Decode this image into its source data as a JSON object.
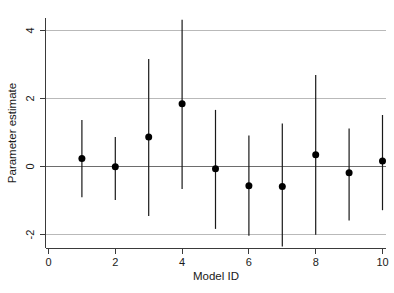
{
  "chart_data": {
    "type": "scatter",
    "title": "",
    "subtitle": "",
    "xlabel": "Model ID",
    "ylabel": "Parameter estimate",
    "xlim": [
      0,
      10.6
    ],
    "ylim": [
      -2.55,
      4.45
    ],
    "xticks": [
      0,
      2,
      4,
      6,
      8,
      10
    ],
    "xtick_labels": [
      "0",
      "2",
      "4",
      "6",
      "8",
      "10"
    ],
    "yticks": [
      -2,
      0,
      2,
      4
    ],
    "ytick_labels": [
      "-2",
      "0",
      "2",
      "4"
    ],
    "grid": "horizontal-at-yticks",
    "legend": "none",
    "reference_line": 0,
    "error_bar_style": "vertical-line-no-caps",
    "marker": "filled-circle",
    "x": [
      1,
      2,
      3,
      4,
      5,
      6,
      7,
      8,
      9,
      10
    ],
    "categories": [
      "1",
      "2",
      "3",
      "4",
      "5",
      "6",
      "7",
      "8",
      "9",
      "10"
    ],
    "values": [
      0.22,
      -0.02,
      0.85,
      1.83,
      -0.08,
      -0.58,
      -0.6,
      0.33,
      -0.2,
      0.15
    ],
    "ci_lower": [
      -0.92,
      -1.0,
      -1.47,
      -0.68,
      -1.85,
      -2.05,
      -2.37,
      -2.02,
      -1.6,
      -1.3
    ],
    "ci_upper": [
      1.35,
      0.85,
      3.15,
      4.3,
      1.65,
      0.9,
      1.25,
      2.68,
      1.1,
      1.5
    ],
    "series": [
      {
        "name": "Parameter estimate",
        "points": [
          {
            "model_id": 1,
            "estimate": 0.22,
            "lower": -0.92,
            "upper": 1.35
          },
          {
            "model_id": 2,
            "estimate": -0.02,
            "lower": -1.0,
            "upper": 0.85
          },
          {
            "model_id": 3,
            "estimate": 0.85,
            "lower": -1.47,
            "upper": 3.15
          },
          {
            "model_id": 4,
            "estimate": 1.83,
            "lower": -0.68,
            "upper": 4.3
          },
          {
            "model_id": 5,
            "estimate": -0.08,
            "lower": -1.85,
            "upper": 1.65
          },
          {
            "model_id": 6,
            "estimate": -0.58,
            "lower": -2.05,
            "upper": 0.9
          },
          {
            "model_id": 7,
            "estimate": -0.6,
            "lower": -2.37,
            "upper": 1.25
          },
          {
            "model_id": 8,
            "estimate": 0.33,
            "lower": -2.02,
            "upper": 2.68
          },
          {
            "model_id": 9,
            "estimate": -0.2,
            "lower": -1.6,
            "upper": 1.1
          },
          {
            "model_id": 10,
            "estimate": 0.15,
            "lower": -1.3,
            "upper": 1.5
          }
        ]
      }
    ],
    "colors": {
      "marker": "#000000",
      "errorbar": "#191919",
      "gridline": "#b9b9b9",
      "zeroline": "#6d6d6d",
      "axis": "#3a3a3a",
      "background": "#ffffff"
    }
  }
}
